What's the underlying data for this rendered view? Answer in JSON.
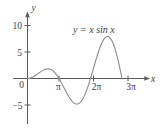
{
  "figure": {
    "name": "plot-of-x-sin-x",
    "background_color": "#ffffff",
    "curve_color": "#8a8a8a",
    "axis_color": "#5a5a5a",
    "text_color": "#3d3d3d"
  },
  "labels": {
    "y_axis": "y",
    "x_axis": "x",
    "equation": "y = x sin x",
    "equation_lhs": "y",
    "equation_eq": "=",
    "equation_rhs_x1": "x",
    "equation_sin": "sin",
    "equation_rhs_x2": "x"
  },
  "chart_data": {
    "type": "line",
    "title": "",
    "subtitle": "",
    "xlabel": "x",
    "ylabel": "y",
    "annotations": [
      {
        "text": "y = x sin x",
        "x": 7.0,
        "y": 9.2
      }
    ],
    "grid": false,
    "legend": null,
    "xlim": [
      -0.6,
      11.0
    ],
    "ylim": [
      -6.6,
      12.5
    ],
    "xticks": [
      {
        "value": 3.14159265,
        "label": "π"
      },
      {
        "value": 6.28318531,
        "label": "2π"
      },
      {
        "value": 9.42477796,
        "label": "3π"
      }
    ],
    "yticks": [
      {
        "value": 10,
        "label": "10"
      },
      {
        "value": 5,
        "label": "5"
      },
      {
        "value": 0,
        "label": "0"
      },
      {
        "value": -5,
        "label": "−5"
      }
    ],
    "series": [
      {
        "name": "y = x sin x",
        "color": "#8a8a8a",
        "function": "x*sin(x)",
        "x_start": 0,
        "x_end": 9.42477796,
        "samples": 240,
        "key_points": [
          {
            "x": 0.0,
            "y": 0.0,
            "note": "origin"
          },
          {
            "x": 2.0288,
            "y": 1.8197,
            "note": "local maximum"
          },
          {
            "x": 3.14159,
            "y": 0.0,
            "note": "zero at pi"
          },
          {
            "x": 4.9132,
            "y": -4.8138,
            "note": "local minimum"
          },
          {
            "x": 6.28319,
            "y": 0.0,
            "note": "zero at 2pi"
          },
          {
            "x": 7.9787,
            "y": 7.9167,
            "note": "local maximum"
          },
          {
            "x": 9.42478,
            "y": 0.0,
            "note": "zero at 3pi"
          }
        ]
      }
    ]
  }
}
